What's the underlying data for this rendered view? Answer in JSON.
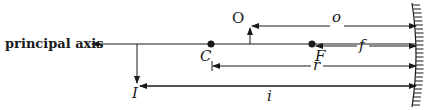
{
  "diagram": {
    "type": "concave-mirror-ray-geometry",
    "colors": {
      "ink": "#1a1a1a",
      "background": "#ffffff"
    },
    "labels": {
      "principal_axis": "principal axis",
      "center_of_curvature": "C",
      "focal_point": "F",
      "object": "O",
      "image": "I",
      "object_distance": "o",
      "focal_length": "f",
      "radius": "r",
      "image_distance": "i"
    },
    "points": [
      {
        "name": "C",
        "x": 211,
        "y": 44
      },
      {
        "name": "F",
        "x": 312,
        "y": 44
      }
    ],
    "arrows": [
      {
        "name": "object",
        "from": [
          250,
          44
        ],
        "to": [
          250,
          29
        ]
      },
      {
        "name": "image",
        "from": [
          137,
          44
        ],
        "to": [
          137,
          82
        ]
      }
    ],
    "dimensions": [
      {
        "name": "o",
        "x1": 252,
        "x2": 416,
        "y": 26
      },
      {
        "name": "f",
        "x1": 316,
        "x2": 416,
        "y": 46
      },
      {
        "name": "r",
        "x1": 213,
        "x2": 416,
        "y": 66
      },
      {
        "name": "i",
        "x1": 140,
        "x2": 416,
        "y": 86
      }
    ]
  }
}
